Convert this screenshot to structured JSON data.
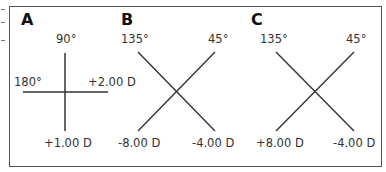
{
  "panels": [
    {
      "letter": "A",
      "labels": {
        "top": "90°",
        "left": "180°",
        "right": "+2.00 D",
        "bottom": "+1.00 D"
      }
    },
    {
      "letter": "B",
      "labels": {
        "top_left": "135°",
        "top_right": "45°",
        "bottom_left": "-8.00 D",
        "bottom_right": "-4.00 D"
      }
    },
    {
      "letter": "C",
      "labels": {
        "top_left": "135°",
        "top_right": "45°",
        "bottom_left": "+8.00 D",
        "bottom_right": "-4.00 D"
      }
    }
  ],
  "colors": {
    "line": "#333333",
    "border": "#555555"
  }
}
